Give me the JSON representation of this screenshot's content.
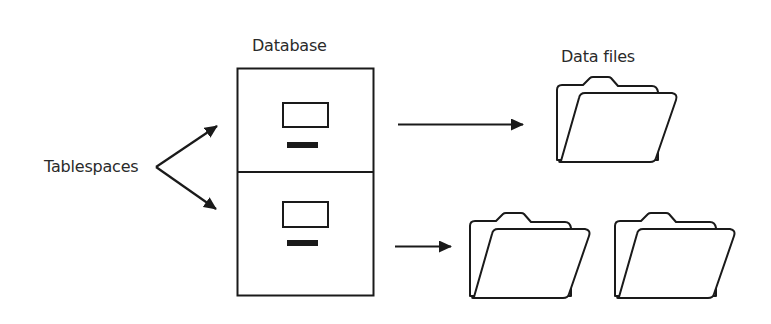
{
  "diagram": {
    "labels": {
      "tablespaces": "Tablespaces",
      "database": "Database",
      "data_files": "Data files"
    },
    "nodes": [
      {
        "id": "tablespaces",
        "type": "text-label",
        "label": "Tablespaces"
      },
      {
        "id": "database",
        "type": "filing-cabinet",
        "label": "Database",
        "drawers": 2
      },
      {
        "id": "data-file-1",
        "type": "folder",
        "group": "Data files",
        "drawer": 1
      },
      {
        "id": "data-file-2",
        "type": "folder",
        "group": "Data files",
        "drawer": 2
      },
      {
        "id": "data-file-3",
        "type": "folder",
        "group": "Data files",
        "drawer": 2
      }
    ],
    "edges": [
      {
        "from": "tablespaces",
        "to": "database.drawer-1"
      },
      {
        "from": "tablespaces",
        "to": "database.drawer-2"
      },
      {
        "from": "database.drawer-1",
        "to": "data-file-1"
      },
      {
        "from": "database.drawer-2",
        "to": "data-file-2"
      }
    ],
    "colors": {
      "stroke": "#1a1a1a",
      "text": "#2a2a2a",
      "background": "#ffffff"
    }
  }
}
